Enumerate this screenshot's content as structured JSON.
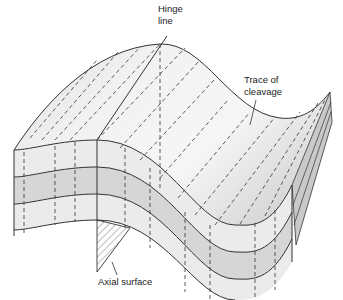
{
  "figure": {
    "type": "geological-fold-block-diagram",
    "labels": {
      "hinge_line": [
        "Hinge",
        "line"
      ],
      "trace_of_cleavage": [
        "Trace of",
        "cleavage"
      ],
      "axial_surface": "Axial surface"
    },
    "colors": {
      "line": "#333333",
      "top_surface_light": "#f4f4f4",
      "top_surface_shade": "#dcdcdc",
      "layer_light": "#ececec",
      "layer_dark": "#d4d4d4",
      "end_face": "#c8c8c8",
      "background": "#ffffff"
    }
  }
}
